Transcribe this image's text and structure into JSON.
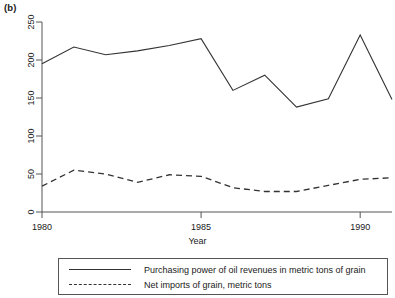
{
  "figure": {
    "panel_label": "(b)",
    "xlabel": "Year",
    "ylabel": "Millions of metric tons of grain"
  },
  "legend": {
    "entries": [
      {
        "label": "Purchasing power of oil revenues in metric tons of grain",
        "style": "solid",
        "key": "line-key-solid"
      },
      {
        "label": "Net imports of grain, metric tons",
        "style": "dashed",
        "key": "line-key-dashed"
      }
    ]
  },
  "chart_data": {
    "type": "line",
    "title": "(b)",
    "xlabel": "Year",
    "ylabel": "Millions of metric tons of grain",
    "x": [
      1980,
      1981,
      1982,
      1983,
      1984,
      1985,
      1986,
      1987,
      1988,
      1989,
      1990,
      1991
    ],
    "xlim": [
      1980,
      1991
    ],
    "ylim": [
      0,
      250
    ],
    "xticks": [
      1980,
      1985,
      1990
    ],
    "xtick_labels": [
      "1980",
      "1985",
      "1990"
    ],
    "yticks": [
      0,
      50,
      100,
      150,
      200,
      250
    ],
    "ytick_labels": [
      "0",
      "50",
      "100",
      "150",
      "200",
      "250"
    ],
    "grid": false,
    "legend_position": "below",
    "line_color": "#333333",
    "series": [
      {
        "name": "Purchasing power of oil revenues in metric tons of grain",
        "style": "solid",
        "values": [
          195,
          217,
          207,
          212,
          219,
          228,
          160,
          180,
          138,
          149,
          233,
          148
        ]
      },
      {
        "name": "Net imports of grain, metric tons",
        "style": "dashed",
        "values": [
          34,
          55,
          50,
          39,
          49,
          47,
          32,
          27,
          27,
          35,
          43,
          45
        ]
      }
    ]
  }
}
